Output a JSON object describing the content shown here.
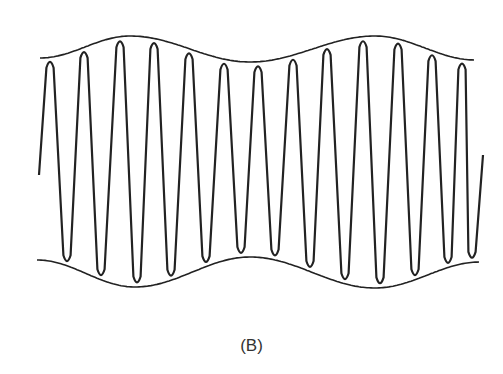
{
  "figure": {
    "caption": "(B)",
    "colors": {
      "line": "#222222",
      "background": "#ffffff",
      "caption": "#333333"
    },
    "carrier": {
      "peaks_x": [
        50,
        84,
        120,
        154,
        189,
        224,
        258,
        293,
        327,
        363,
        398,
        432,
        462
      ],
      "troughs_x": [
        67,
        101,
        137,
        171,
        206,
        241,
        275,
        310,
        345,
        380,
        415,
        448,
        472
      ],
      "start_point": [
        39,
        175
      ],
      "end_point": [
        483,
        155
      ]
    },
    "upper_envelope": {
      "points": [
        [
          40,
          58
        ],
        [
          130,
          36
        ],
        [
          250,
          62
        ],
        [
          375,
          36
        ],
        [
          475,
          60
        ]
      ]
    },
    "lower_envelope": {
      "points": [
        [
          37,
          260
        ],
        [
          135,
          287
        ],
        [
          250,
          257
        ],
        [
          375,
          288
        ],
        [
          480,
          262
        ]
      ]
    }
  }
}
